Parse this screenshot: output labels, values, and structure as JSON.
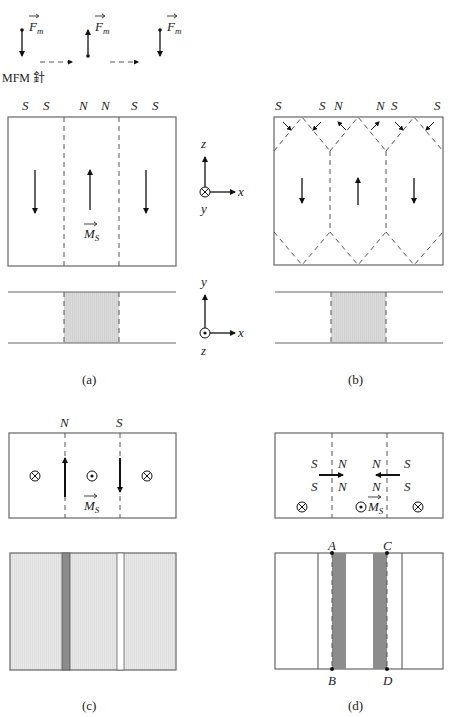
{
  "probe": {
    "force_label": "F",
    "force_sub": "m",
    "needle_label": "MFM 針",
    "forces": [
      {
        "x": 22,
        "direction": "down"
      },
      {
        "x": 88,
        "direction": "up"
      },
      {
        "x": 160,
        "direction": "down"
      }
    ]
  },
  "panel_a": {
    "caption": "(a)",
    "poles": [
      "S",
      "S",
      "N",
      "N",
      "S",
      "S"
    ],
    "magnetization_label": "M",
    "magnetization_sub": "S",
    "domain_arrows": [
      "down",
      "up",
      "down"
    ],
    "axes_top": {
      "vertical": "z",
      "horizontal": "x",
      "into": "y",
      "symbol": "into-page"
    },
    "axes_bottom": {
      "vertical": "y",
      "horizontal": "x",
      "out": "z",
      "symbol": "out-of-page"
    }
  },
  "panel_b": {
    "caption": "(b)",
    "poles": [
      "S",
      "S",
      "N",
      "N",
      "S",
      "S"
    ],
    "domain_arrows": [
      "down",
      "up",
      "down"
    ]
  },
  "panel_c": {
    "caption": "(c)",
    "poles": [
      "N",
      "S"
    ],
    "magnetization_label": "M",
    "magnetization_sub": "S",
    "symbols": [
      "into-page",
      "out-of-page",
      "into-page"
    ],
    "wall_arrows": [
      "up",
      "down"
    ]
  },
  "panel_d": {
    "caption": "(d)",
    "poles_row1": [
      "S",
      "N",
      "N",
      "S"
    ],
    "poles_row2": [
      "S",
      "N",
      "N",
      "S"
    ],
    "magnetization_label": "M",
    "magnetization_sub": "S",
    "symbols": [
      "into-page",
      "out-of-page",
      "into-page"
    ],
    "points": [
      "A",
      "B",
      "C",
      "D"
    ]
  },
  "colors": {
    "line": "#666666",
    "shade_light": "#d9d9d9",
    "shade_lighter": "#e6e6e6",
    "shade_dark": "#8c8c8c"
  }
}
